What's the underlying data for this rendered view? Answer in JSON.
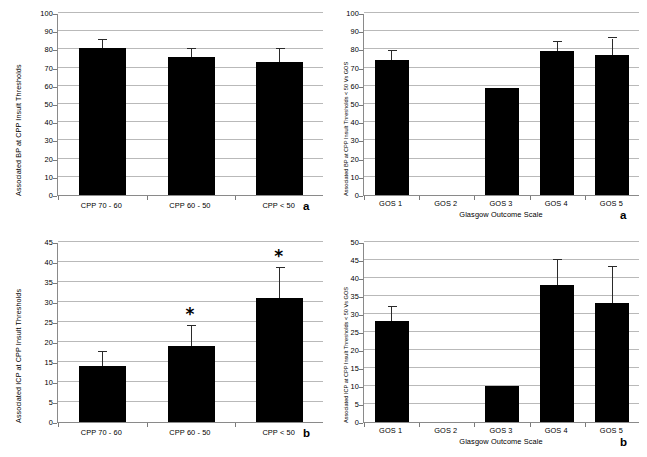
{
  "figure": {
    "background": "#ffffff",
    "bar_color": "#000000",
    "grid_color": "#b9b9b9",
    "axis_color": "#8a8a8a"
  },
  "chart_data": [
    {
      "id": "top-left",
      "type": "bar",
      "panel_letter": "a",
      "title": "",
      "xlabel": "",
      "ylabel": "Associated BP at CPP Insult Thresholds",
      "categories": [
        "CPP 70 - 60",
        "CPP 60 - 50",
        "CPP < 50"
      ],
      "values": [
        81,
        76,
        73
      ],
      "errors_upper": [
        85,
        80,
        80.5
      ],
      "significance": [
        "",
        "",
        ""
      ],
      "ylim": [
        0,
        100
      ],
      "ytick_step": 10,
      "yticks": [
        0,
        10,
        20,
        30,
        40,
        50,
        60,
        70,
        80,
        90,
        100
      ],
      "grid": true,
      "legend": "none"
    },
    {
      "id": "top-right",
      "type": "bar",
      "panel_letter": "a",
      "title": "",
      "xlabel": "Glasgow Outcome Scale",
      "ylabel": "Associated BP at CPP Insult Thresholds < 50 Vs GOS",
      "categories": [
        "GOS 1",
        "GOS 2",
        "GOS 3",
        "GOS 4",
        "GOS 5"
      ],
      "values": [
        74,
        0,
        59,
        79,
        77
      ],
      "errors_upper": [
        79,
        0,
        0,
        84,
        86
      ],
      "significance": [
        "",
        "",
        "",
        "",
        ""
      ],
      "ylim": [
        0,
        100
      ],
      "ytick_step": 10,
      "yticks": [
        0,
        10,
        20,
        30,
        40,
        50,
        60,
        70,
        80,
        90,
        100
      ],
      "grid": true,
      "legend": "none"
    },
    {
      "id": "bottom-left",
      "type": "bar",
      "panel_letter": "b",
      "title": "",
      "xlabel": "",
      "ylabel": "Associated ICP at CPP Insult Thresholds",
      "categories": [
        "CPP 70 - 60",
        "CPP 60 - 50",
        "CPP < 50"
      ],
      "values": [
        14,
        19,
        31
      ],
      "errors_upper": [
        17.5,
        24,
        38.5
      ],
      "significance": [
        "",
        "*",
        "*"
      ],
      "ylim": [
        0,
        45
      ],
      "ytick_step": 5,
      "yticks": [
        0,
        5,
        10,
        15,
        20,
        25,
        30,
        35,
        40,
        45
      ],
      "grid": true,
      "legend": "none"
    },
    {
      "id": "bottom-right",
      "type": "bar",
      "panel_letter": "b",
      "title": "",
      "xlabel": "Glasgow Outcome Scale",
      "ylabel": "Associated ICP at CPP Insult Thresholds < 50 Vs GOS",
      "categories": [
        "GOS 1",
        "GOS 2",
        "GOS 3",
        "GOS 4",
        "GOS 5"
      ],
      "values": [
        28,
        0,
        10,
        38,
        33
      ],
      "errors_upper": [
        32,
        0,
        0,
        45,
        43
      ],
      "significance": [
        "",
        "",
        "",
        "",
        ""
      ],
      "ylim": [
        0,
        50
      ],
      "ytick_step": 5,
      "yticks": [
        0,
        5,
        10,
        15,
        20,
        25,
        30,
        35,
        40,
        45,
        50
      ],
      "grid": true,
      "legend": "none"
    }
  ]
}
